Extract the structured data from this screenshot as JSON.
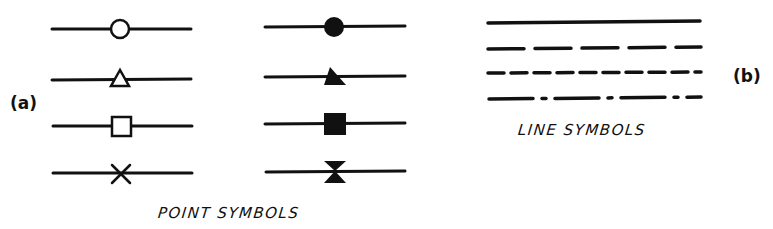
{
  "labels": {
    "panel_a": "(a)",
    "panel_b": "(b)",
    "point_caption": "POINT SYMBOLS",
    "line_caption": "LINE SYMBOLS"
  },
  "colors": {
    "ink": "#111111",
    "background": "#ffffff"
  },
  "point_symbols": {
    "open": [
      "open-circle",
      "open-triangle",
      "open-square",
      "cross"
    ],
    "filled": [
      "filled-circle",
      "filled-triangle",
      "filled-square",
      "bowtie"
    ]
  },
  "line_symbols": [
    "solid",
    "long-dash",
    "short-dash",
    "dash-dot"
  ]
}
